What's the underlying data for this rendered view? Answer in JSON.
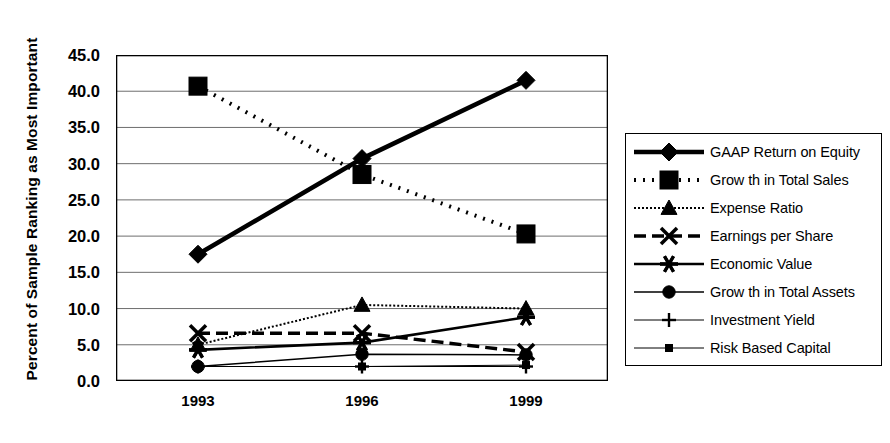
{
  "chart_data": {
    "type": "line",
    "title": "",
    "xlabel": "",
    "ylabel": "Percent of Sample Ranking as Most Important",
    "categories": [
      "1993",
      "1996",
      "1999"
    ],
    "x": [
      1993,
      1996,
      1999
    ],
    "ylim": [
      0.0,
      45.0
    ],
    "ytick_labels": [
      "0.0",
      "5.0",
      "10.0",
      "15.0",
      "20.0",
      "25.0",
      "30.0",
      "35.0",
      "40.0",
      "45.0"
    ],
    "ytick_values": [
      0,
      5,
      10,
      15,
      20,
      25,
      30,
      35,
      40,
      45
    ],
    "grid": "horizontal",
    "legend_position": "right",
    "series": [
      {
        "name": "GAAP Return on Equity",
        "values": [
          17.5,
          30.7,
          41.5
        ],
        "marker": "diamond",
        "line": "solid-thick"
      },
      {
        "name": "Grow th in Total Sales",
        "values": [
          40.7,
          28.5,
          20.3
        ],
        "marker": "square",
        "line": "dotted-thick"
      },
      {
        "name": "Expense Ratio",
        "values": [
          5.0,
          10.5,
          10.0
        ],
        "marker": "triangle",
        "line": "wavy"
      },
      {
        "name": "Earnings per Share",
        "values": [
          6.6,
          6.6,
          4.0
        ],
        "marker": "x",
        "line": "dashed-thick"
      },
      {
        "name": "Economic Value",
        "values": [
          4.3,
          5.3,
          8.8
        ],
        "marker": "asterisk",
        "line": "solid-medium"
      },
      {
        "name": "Grow th in Total Assets",
        "values": [
          2.0,
          3.7,
          3.6
        ],
        "marker": "circle",
        "line": "solid-thin"
      },
      {
        "name": "Investment Yield",
        "values": [
          2.0,
          2.0,
          2.0
        ],
        "marker": "plus",
        "line": "solid-hairline"
      },
      {
        "name": "Risk Based Capital",
        "values": [
          2.0,
          2.0,
          2.2
        ],
        "marker": "small-square",
        "line": "solid-hairline"
      }
    ]
  },
  "axis": {
    "y_title": "Percent of Sample Ranking as Most Important"
  },
  "colors": {
    "ink": "#000000",
    "grid": "#6e6e6e",
    "background": "#ffffff"
  }
}
